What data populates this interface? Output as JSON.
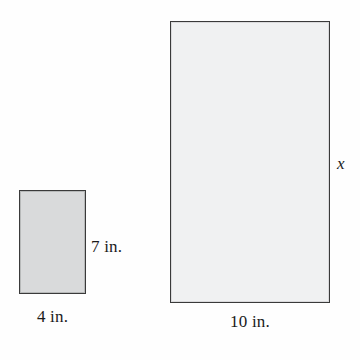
{
  "figure": {
    "background_color": "#fefefe",
    "shapes": {
      "small_rectangle": {
        "name": "small rectangle",
        "fill_color": "#d9dadb",
        "stroke_color": "#3a3a3a",
        "width_label": "4 in.",
        "height_label": "7 in.",
        "width_value": 4,
        "height_value": 7,
        "units": "in."
      },
      "large_rectangle": {
        "name": "large rectangle",
        "fill_color": "#f0f1f2",
        "stroke_color": "#3a3a3a",
        "width_label": "10 in.",
        "height_label": "x",
        "width_value": 10,
        "height_value": "x",
        "units": "in."
      }
    },
    "labels": {
      "small_height": "7 in.",
      "small_width": "4 in.",
      "large_width": "10 in.",
      "large_height": "x"
    }
  }
}
